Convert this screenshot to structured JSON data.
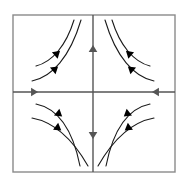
{
  "figure": {
    "type": "phase-portrait",
    "background_color": "#ffffff",
    "frame": {
      "name": "plot-frame",
      "x": 13,
      "y": 15,
      "width": 162,
      "height": 157,
      "stroke_color": "#8a8a8a",
      "stroke_width": 1.4,
      "fill": "none"
    },
    "axes": {
      "stroke_color": "#555555",
      "stroke_width": 1.4,
      "origin": {
        "x": 93,
        "y": 92
      },
      "horizontal": {
        "x1": 13,
        "y1": 92,
        "x2": 175,
        "y2": 92
      },
      "vertical": {
        "x1": 93,
        "y1": 15,
        "x2": 93,
        "y2": 172
      }
    },
    "axis_arrows": [
      {
        "name": "axis-arrow-left",
        "x": 34,
        "y": 92,
        "direction": "right",
        "points_toward": "origin",
        "size": 7
      },
      {
        "name": "axis-arrow-right",
        "x": 156,
        "y": 92,
        "direction": "left",
        "points_toward": "origin",
        "size": 7
      },
      {
        "name": "axis-arrow-up",
        "x": 93,
        "y": 49,
        "direction": "up",
        "points_toward": "away-from-origin",
        "size": 7
      },
      {
        "name": "axis-arrow-down",
        "x": 93,
        "y": 135,
        "direction": "down",
        "points_toward": "away-from-origin",
        "size": 7
      }
    ],
    "trajectories": [
      {
        "name": "trajectory-q2-inner",
        "quadrant": "upper-left",
        "path": "M 36,66 C 52,62 66,46 74,20",
        "arrow": {
          "x": 57,
          "y": 53.5,
          "angle": -41
        }
      },
      {
        "name": "trajectory-q2-outer",
        "quadrant": "upper-left",
        "path": "M 32,81 C 52,77 70,57 81,20",
        "arrow": {
          "x": 55,
          "y": 69,
          "angle": -40
        }
      },
      {
        "name": "trajectory-q1-inner",
        "quadrant": "upper-right",
        "path": "M 112,20 C 120,46 134,62 150,66",
        "arrow": {
          "x": 129,
          "y": 53.5,
          "angle": 221
        }
      },
      {
        "name": "trajectory-q1-outer",
        "quadrant": "upper-right",
        "path": "M 105,20 C 116,57 134,77 154,81",
        "arrow": {
          "x": 131,
          "y": 69,
          "angle": 220
        }
      },
      {
        "name": "trajectory-q3-inner",
        "quadrant": "lower-left",
        "path": "M 36,104 C 56,108 72,126 80,166",
        "arrow": {
          "x": 59,
          "y": 114,
          "angle": 38
        }
      },
      {
        "name": "trajectory-q3-outer",
        "quadrant": "lower-left",
        "path": "M 32,118 C 54,122 72,138 88,166",
        "arrow": {
          "x": 58,
          "y": 128,
          "angle": 36
        }
      },
      {
        "name": "trajectory-q4-inner",
        "quadrant": "lower-right",
        "path": "M 106,166 C 114,126 130,108 150,104",
        "arrow": {
          "x": 127,
          "y": 114,
          "angle": 142
        }
      },
      {
        "name": "trajectory-q4-outer",
        "quadrant": "lower-right",
        "path": "M 98,166 C 114,138 132,122 154,118",
        "arrow": {
          "x": 128,
          "y": 128,
          "angle": 144
        }
      }
    ],
    "curve_style": {
      "stroke_color": "#1a1a1a",
      "stroke_width": 1.1,
      "fill": "none",
      "arrow_color": "#000000",
      "arrow_size": 7
    }
  }
}
